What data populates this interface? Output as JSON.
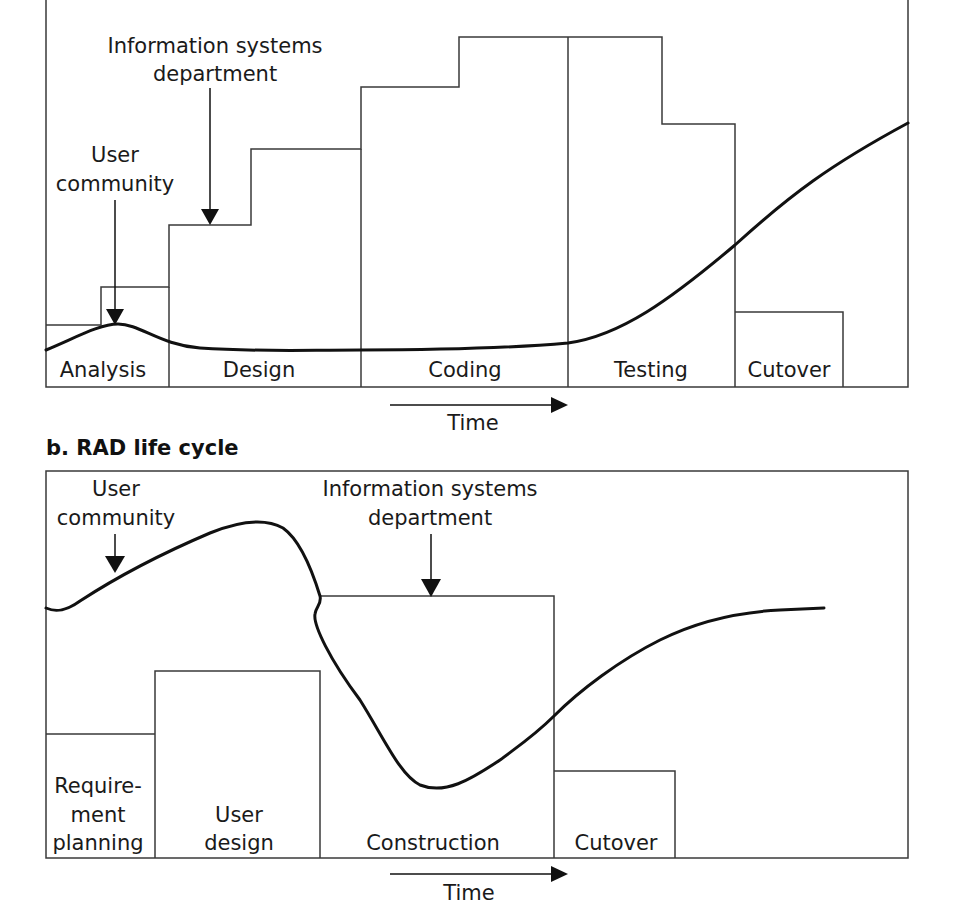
{
  "panel_a": {
    "phases": [
      {
        "label": "Analysis"
      },
      {
        "label": "Design"
      },
      {
        "label": "Coding"
      },
      {
        "label": "Testing"
      },
      {
        "label": "Cutover"
      }
    ],
    "annotations": {
      "user_community_line1": "User",
      "user_community_line2": "community",
      "is_department_line1": "Information systems",
      "is_department_line2": "department"
    },
    "time_label": "Time"
  },
  "panel_b": {
    "title": "b. RAD life cycle",
    "phases": [
      {
        "label_lines": [
          "Require-",
          "ment",
          "planning"
        ]
      },
      {
        "label_lines": [
          "User",
          "design"
        ]
      },
      {
        "label_lines": [
          "Construction"
        ]
      },
      {
        "label_lines": [
          "Cutover"
        ]
      }
    ],
    "annotations": {
      "user_community_line1": "User",
      "user_community_line2": "community",
      "is_department_line1": "Information systems",
      "is_department_line2": "department"
    },
    "time_label": "Time"
  },
  "colors": {
    "line": "#3a3a3a",
    "curve": "#111111",
    "background": "#ffffff"
  }
}
